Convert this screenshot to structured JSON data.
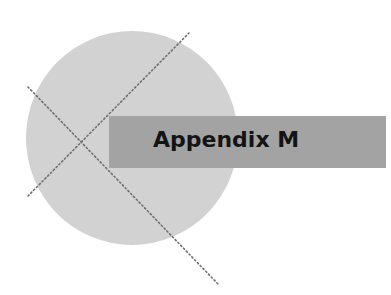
{
  "title": "Appendix M",
  "colors": {
    "background": "#ffffff",
    "circle": "#d2d2d2",
    "banner": "#a3a3a3",
    "text": "#141414",
    "dotted_lines": "#6e6e6e"
  }
}
